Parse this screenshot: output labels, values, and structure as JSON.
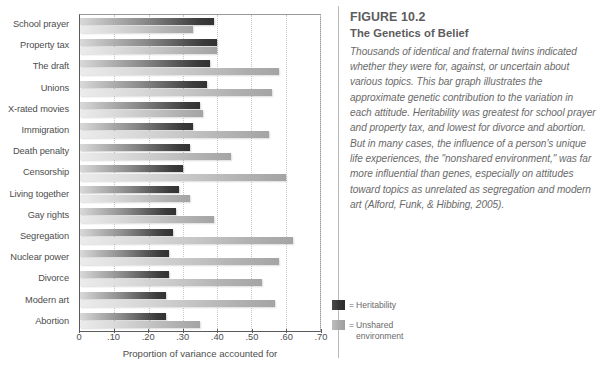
{
  "figure": {
    "number": "FIGURE 10.2",
    "title": "The Genetics of Belief",
    "body": "Thousands of identical and fraternal twins indicated whether they were for, against, or uncertain about various topics. This bar graph illustrates the approximate genetic contribution to the variation in each attitude.  Heritability was greatest for school prayer and property tax, and lowest for divorce and abortion. But in many cases, the influence of a person's unique life experiences, the \"nonshared environment,\" was far more influential than genes, especially on attitudes toward topics as unrelated as segregation and modern art (Alford, Funk, & Hibbing, 2005)."
  },
  "legend": {
    "equals": "=",
    "items": [
      {
        "swatch": "dark",
        "label": "Heritability"
      },
      {
        "swatch": "light",
        "label": "Unshared\nenvironment"
      }
    ]
  },
  "colors": {
    "heritability_dark": "#333333",
    "unshared_light": "#b0b0b0",
    "text": "#4d4d4d",
    "caption_text": "#6a6a6a",
    "gridline": "#c9c9c9",
    "axis": "#5a5a5a"
  },
  "chart_data": {
    "type": "bar",
    "orientation": "horizontal",
    "title": "The Genetics of Belief",
    "xlabel": "Proportion of variance accounted for",
    "ylabel": "",
    "xlim": [
      0,
      0.7
    ],
    "xticks": [
      0,
      0.1,
      0.2,
      0.3,
      0.4,
      0.5,
      0.6,
      0.7
    ],
    "xticklabels": [
      "0",
      ".10",
      ".20",
      ".30",
      ".40",
      ".50",
      ".60",
      ".70"
    ],
    "grid": "vertical-dotted",
    "legend_position": "outside-right-bottom",
    "categories": [
      "School prayer",
      "Property tax",
      "The draft",
      "Unions",
      "X-rated movies",
      "Immigration",
      "Death penalty",
      "Censorship",
      "Living together",
      "Gay rights",
      "Segregation",
      "Nuclear power",
      "Divorce",
      "Modern art",
      "Abortion"
    ],
    "series": [
      {
        "name": "Heritability",
        "color": "#333333",
        "values": [
          0.39,
          0.4,
          0.38,
          0.37,
          0.35,
          0.33,
          0.32,
          0.3,
          0.29,
          0.28,
          0.27,
          0.26,
          0.26,
          0.25,
          0.25
        ]
      },
      {
        "name": "Unshared environment",
        "color": "#b0b0b0",
        "values": [
          0.33,
          0.4,
          0.58,
          0.56,
          0.36,
          0.55,
          0.44,
          0.6,
          0.32,
          0.39,
          0.62,
          0.58,
          0.53,
          0.57,
          0.35
        ]
      }
    ]
  }
}
